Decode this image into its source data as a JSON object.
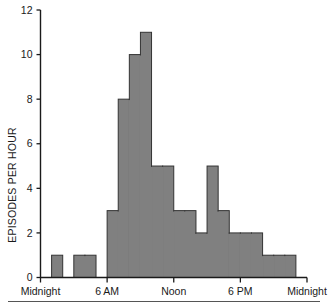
{
  "chart_data": {
    "type": "bar",
    "title": "",
    "subtitle": "",
    "xlabel": "",
    "ylabel": "EPISODES PER HOUR",
    "ylim": [
      0,
      12
    ],
    "xlim": [
      0,
      24
    ],
    "grid": false,
    "legend": null,
    "bar_color": "#808080",
    "bar_edge_color": "#333333",
    "axis_color": "#1a1a1a",
    "ytick_labels": [
      "0",
      "2",
      "4",
      "6",
      "8",
      "10",
      "12"
    ],
    "ytick_values": [
      0,
      2,
      4,
      6,
      8,
      10,
      12
    ],
    "xtick_labels": [
      "Midnight",
      "6 AM",
      "Noon",
      "6 PM",
      "Midnight"
    ],
    "xtick_values": [
      0,
      6,
      12,
      18,
      24
    ],
    "categories": [
      "0",
      "1",
      "2",
      "3",
      "4",
      "5",
      "6",
      "7",
      "8",
      "9",
      "10",
      "11",
      "12",
      "13",
      "14",
      "15",
      "16",
      "17",
      "18",
      "19",
      "20",
      "21",
      "22",
      "23"
    ],
    "values": [
      0,
      1,
      0,
      1,
      1,
      0,
      3,
      8,
      10,
      11,
      5,
      5,
      3,
      3,
      2,
      5,
      3,
      2,
      2,
      2,
      1,
      1,
      1,
      0
    ],
    "bin_width_hours": 1,
    "x_unit": "hour of day"
  },
  "axis": {
    "y_title": "EPISODES PER HOUR"
  },
  "footer": {
    "rule": ""
  }
}
